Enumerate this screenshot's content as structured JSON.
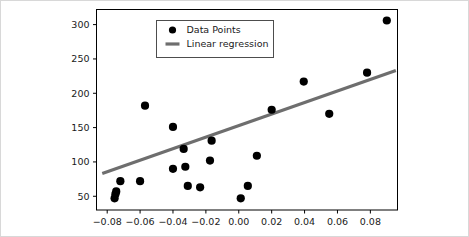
{
  "chart_data": {
    "type": "scatter",
    "title": "",
    "xlabel": "",
    "ylabel": "",
    "xlim": [
      -0.0865,
      0.0965
    ],
    "ylim": [
      30,
      322
    ],
    "grid": false,
    "legend_position": "upper left inside",
    "x_ticks": [
      -0.08,
      -0.06,
      -0.04,
      -0.02,
      0.0,
      0.02,
      0.04,
      0.06,
      0.08
    ],
    "x_tick_labels": [
      "−0.08",
      "−0.06",
      "−0.04",
      "−0.02",
      "0.00",
      "0.02",
      "0.04",
      "0.06",
      "0.08"
    ],
    "y_ticks": [
      50,
      100,
      150,
      200,
      250,
      300
    ],
    "y_tick_labels": [
      "50",
      "100",
      "150",
      "200",
      "250",
      "300"
    ],
    "series": [
      {
        "name": "Data Points",
        "type": "scatter",
        "marker": "circle",
        "color": "#000000",
        "marker_size": 5.4,
        "points": [
          {
            "x": -0.0755,
            "y": 47
          },
          {
            "x": -0.0745,
            "y": 57
          },
          {
            "x": -0.075,
            "y": 53
          },
          {
            "x": -0.072,
            "y": 72
          },
          {
            "x": -0.06,
            "y": 72
          },
          {
            "x": -0.057,
            "y": 182
          },
          {
            "x": -0.04,
            "y": 151
          },
          {
            "x": -0.04,
            "y": 90
          },
          {
            "x": -0.0335,
            "y": 119
          },
          {
            "x": -0.0325,
            "y": 93
          },
          {
            "x": -0.031,
            "y": 65
          },
          {
            "x": -0.0235,
            "y": 63
          },
          {
            "x": -0.0165,
            "y": 131
          },
          {
            "x": -0.0175,
            "y": 102
          },
          {
            "x": 0.0012,
            "y": 47
          },
          {
            "x": 0.0055,
            "y": 65
          },
          {
            "x": 0.011,
            "y": 109
          },
          {
            "x": 0.02,
            "y": 176
          },
          {
            "x": 0.0395,
            "y": 217
          },
          {
            "x": 0.055,
            "y": 170
          },
          {
            "x": 0.078,
            "y": 230
          },
          {
            "x": 0.09,
            "y": 306
          }
        ]
      },
      {
        "name": "Linear regression",
        "type": "line",
        "color": "#6e6e6e",
        "line_width": 3.2,
        "endpoints": [
          {
            "x": -0.083,
            "y": 83
          },
          {
            "x": 0.0955,
            "y": 233
          }
        ],
        "slope": 840,
        "intercept": 152.7
      }
    ]
  },
  "legend": {
    "entries": [
      {
        "label": "Data Points",
        "marker": "circle-marker",
        "color": "#000000"
      },
      {
        "label": "Linear regression",
        "marker": "line-marker",
        "color": "#6e6e6e"
      }
    ]
  },
  "colors": {
    "marker": "#000000",
    "regression_line": "#6e6e6e",
    "axis": "#000000",
    "text": "#1a1a1a",
    "figure_background": "#ffffff",
    "outer_border": "#d8d8d8"
  }
}
